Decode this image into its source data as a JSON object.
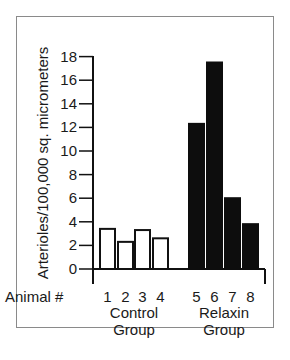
{
  "chart_data": {
    "type": "bar",
    "title": "",
    "xlabel": "Animal #",
    "ylabel": "Arterioles/100,000 sq. micrometers",
    "ylim": [
      0,
      18
    ],
    "yticks": [
      0,
      2,
      4,
      6,
      8,
      10,
      12,
      14,
      16,
      18
    ],
    "categories": [
      "1",
      "2",
      "3",
      "4",
      "5",
      "6",
      "7",
      "8"
    ],
    "values": [
      3.4,
      2.3,
      3.3,
      2.6,
      12.3,
      17.5,
      6.0,
      3.8
    ],
    "groups": [
      {
        "name": "Control Group",
        "line1": "Control",
        "line2": "Group",
        "animals": [
          "1",
          "2",
          "3",
          "4"
        ],
        "values": [
          3.4,
          2.3,
          3.3,
          2.6
        ],
        "fill": "#ffffff",
        "stroke": "#111111"
      },
      {
        "name": "Relaxin Group",
        "line1": "Relaxin",
        "line2": "Group",
        "animals": [
          "5",
          "6",
          "7",
          "8"
        ],
        "values": [
          12.3,
          17.5,
          6.0,
          3.8
        ],
        "fill": "#0d0d0d",
        "stroke": "#0d0d0d"
      }
    ],
    "grid": false,
    "legend": "none"
  }
}
